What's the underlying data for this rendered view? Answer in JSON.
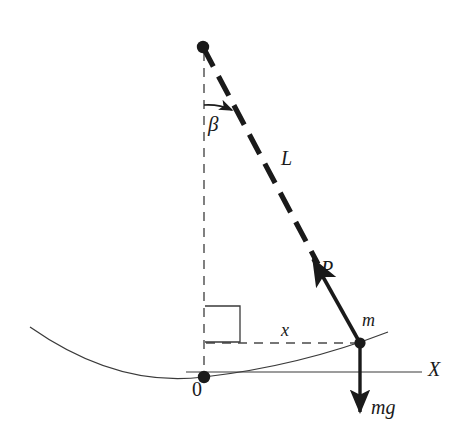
{
  "figure": {
    "type": "physics-diagram",
    "canvas": {
      "width": 468,
      "height": 446,
      "background": "#ffffff"
    },
    "stroke_color": "#1a1a1a",
    "labels": {
      "angle": "β",
      "rod_length": "L",
      "tension": "P",
      "mass": "m",
      "horizontal_displacement": "x",
      "origin": "0",
      "x_axis": "X",
      "weight": "mg"
    },
    "geometry": {
      "pivot": {
        "x": 203,
        "y": 47
      },
      "origin": {
        "x": 204,
        "y": 377
      },
      "mass": {
        "x": 360,
        "y": 343
      },
      "rod_dashed_end": {
        "x": 318,
        "y": 264
      },
      "tension_arrow_tip": {
        "x": 309,
        "y": 254
      },
      "weight_arrow_tip": {
        "x": 360,
        "y": 416
      },
      "x_axis_line": {
        "x1": 186,
        "y1": 372,
        "x2": 422,
        "y2": 372
      },
      "x_distance_line": {
        "x1": 206,
        "y1": 343,
        "x2": 358,
        "y2": 343
      },
      "right_angle_box": {
        "x": 205,
        "y": 306,
        "width": 35,
        "height": 36
      },
      "parabola": {
        "left_x": 30,
        "left_y": 327,
        "vertex_x": 204,
        "vertex_y": 377,
        "right_x": 388,
        "right_y": 332
      },
      "angle_arc_radius": 58
    }
  }
}
